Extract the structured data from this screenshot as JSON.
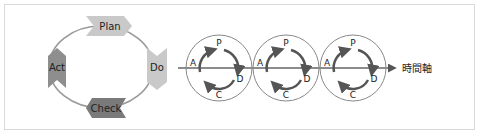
{
  "cycle": {
    "plan": "Plan",
    "do": "Do",
    "check": "Check",
    "act": "Act",
    "colors": {
      "plan": "#c9c9c9",
      "do": "#c9c9c9",
      "check": "#7a7a7a",
      "act": "#8e8e8e",
      "ring": "#9a9a9a"
    }
  },
  "timeline": {
    "axis_label": "時間軸",
    "circles": [
      {
        "p": "P",
        "d": "D",
        "c": "C",
        "a": "A"
      },
      {
        "p": "P",
        "d": "D",
        "c": "C",
        "a": "A"
      },
      {
        "p": "P",
        "d": "D",
        "c": "C",
        "a": "A"
      }
    ],
    "colors": {
      "line": "#666666",
      "arrow": "#555555",
      "circle": "#888888"
    }
  }
}
